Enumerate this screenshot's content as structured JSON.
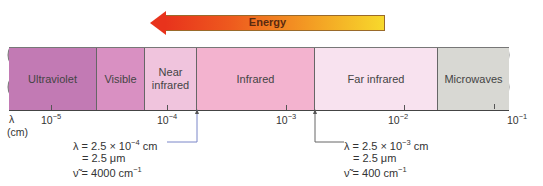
{
  "energy_arrow": {
    "label": "Energy",
    "direction": "left",
    "colors": {
      "start": "#e8331c",
      "end": "#f7d92c"
    }
  },
  "spectrum": {
    "segments": [
      {
        "label": "Ultraviolet",
        "color": "#c27ab4"
      },
      {
        "label": "Visible",
        "color": "#d990c2"
      },
      {
        "label": "Near infrared",
        "color": "#f0c4dd"
      },
      {
        "label": "Infrared",
        "color": "#f3b3cf"
      },
      {
        "label": "Far infrared",
        "color": "#f8e2ef"
      },
      {
        "label": "Microwaves",
        "color": "#d8d8d3"
      }
    ]
  },
  "axis": {
    "symbol": "λ",
    "unit": "(cm)",
    "ticks": [
      {
        "base": "10",
        "exp": "−5"
      },
      {
        "base": "10",
        "exp": "−4"
      },
      {
        "base": "10",
        "exp": "−3"
      },
      {
        "base": "10",
        "exp": "−2"
      },
      {
        "base": "10",
        "exp": "−1"
      }
    ]
  },
  "annotations": [
    {
      "line1": "λ = 2.5 × 10",
      "line1_exp": "−4",
      "line1_unit": " cm",
      "line2": "= 2.5 μm",
      "line3": "ν̃ = 4000 cm",
      "line3_exp": "−1"
    },
    {
      "line1": "λ = 2.5 × 10",
      "line1_exp": "−3",
      "line1_unit": " cm",
      "line2": "= 2.5 μm",
      "line3": "ν̃ = 400 cm",
      "line3_exp": "−1"
    }
  ]
}
